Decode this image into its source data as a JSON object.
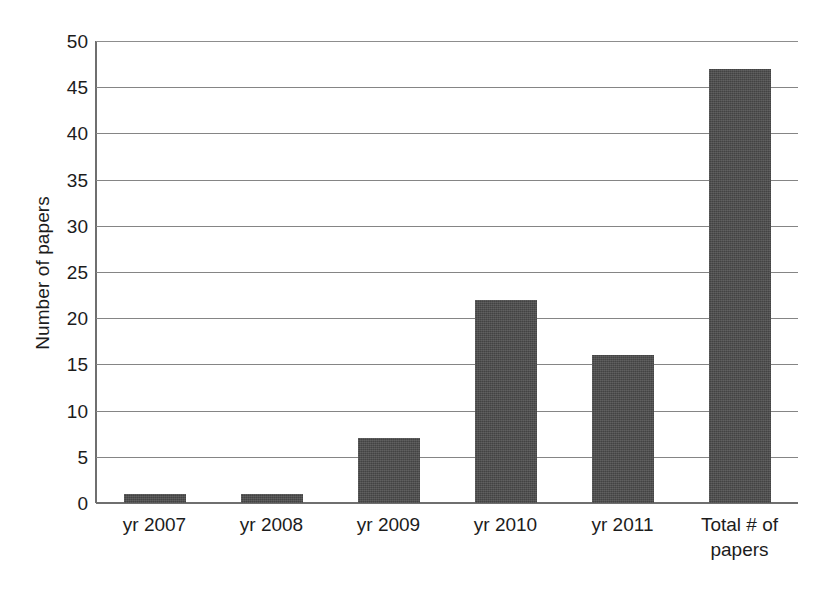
{
  "chart_data": {
    "type": "bar",
    "title": "",
    "subtitle": "",
    "xlabel": "",
    "ylabel": "Number of papers",
    "categories": [
      "yr 2007",
      "yr 2008",
      "yr 2009",
      "yr 2010",
      "yr 2011",
      "Total # of papers"
    ],
    "values": [
      1,
      1,
      7,
      22,
      16,
      47
    ],
    "series": [
      {
        "name": "Number of papers",
        "values": [
          1,
          1,
          7,
          22,
          16,
          47
        ]
      }
    ],
    "ylim": [
      0,
      50
    ],
    "ytick_step": 5,
    "yticks": [
      0,
      5,
      10,
      15,
      20,
      25,
      30,
      35,
      40,
      45,
      50
    ],
    "ytick_labels": [
      "0",
      "5",
      "10",
      "15",
      "20",
      "25",
      "30",
      "35",
      "40",
      "45",
      "50"
    ],
    "xtick_labels": [
      "yr 2007",
      "yr 2008",
      "yr 2009",
      "yr 2010",
      "yr 2011",
      "Total # of papers"
    ],
    "grid": true,
    "grid_axis": "y",
    "legend": false,
    "legend_position": "none",
    "bar_color": "#4b4b4b",
    "gridline_color": "#858585",
    "axis_color": "#6f6f6f",
    "background_color": "#ffffff",
    "text_color": "#1c1c1c",
    "annotations": []
  }
}
